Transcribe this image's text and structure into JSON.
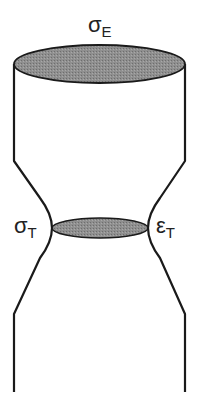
{
  "diagram": {
    "labels": {
      "top_symbol": "σ",
      "top_subscript": "E",
      "left_symbol": "σ",
      "left_subscript": "T",
      "right_symbol": "ε",
      "right_subscript": "T"
    },
    "colors": {
      "outline": "#1a1a1a",
      "ellipse_fill": "#8a8a8a",
      "background": "#ffffff"
    },
    "shapes": {
      "top_ellipse": "cross-section at top of specimen (shaded)",
      "neck_ellipse": "cross-section at necked region (shaded)",
      "specimen_outline": "necked tensile specimen profile"
    }
  }
}
